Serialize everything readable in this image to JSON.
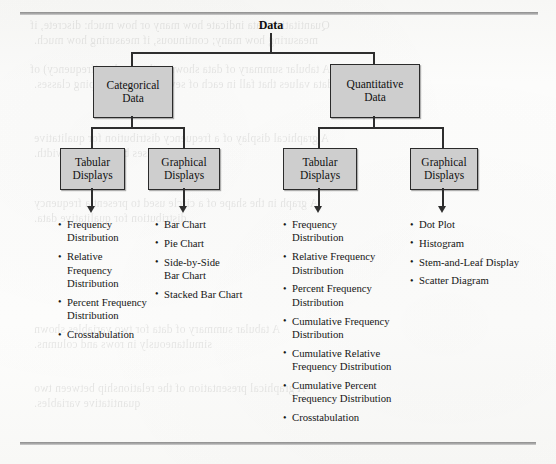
{
  "figure": {
    "root": {
      "label": "Data"
    },
    "level2": [
      {
        "label": "Categorical\nData"
      },
      {
        "label": "Quantitative\nData"
      }
    ],
    "level3": [
      {
        "label": "Tabular\nDisplays"
      },
      {
        "label": "Graphical\nDisplays"
      },
      {
        "label": "Tabular\nDisplays"
      },
      {
        "label": "Graphical\nDisplays"
      }
    ],
    "lists": [
      {
        "name": "categorical-tabular-list",
        "items": [
          "Frequency\nDistribution",
          "Relative Frequency\nDistribution",
          "Percent Frequency\nDistribution",
          "Crosstabulation"
        ]
      },
      {
        "name": "categorical-graphical-list",
        "items": [
          "Bar Chart",
          "Pie Chart",
          "Side-by-Side\nBar Chart",
          "Stacked Bar Chart"
        ]
      },
      {
        "name": "quantitative-tabular-list",
        "items": [
          "Frequency\nDistribution",
          "Relative Frequency\nDistribution",
          "Percent Frequency\nDistribution",
          "Cumulative Frequency\nDistribution",
          "Cumulative Relative\nFrequency Distribution",
          "Cumulative Percent\nFrequency Distribution",
          "Crosstabulation"
        ]
      },
      {
        "name": "quantitative-graphical-list",
        "items": [
          "Dot Plot",
          "Histogram",
          "Stem-and-Leaf Display",
          "Scatter Diagram"
        ]
      }
    ]
  },
  "bleed_through": {
    "line1": "Quantitative data indicate how many or how much: discrete, if",
    "line2": "measuring how many; continuous, if measuring how much.",
    "line3": "A tabular summary of data showing the number (frequency) of",
    "line4": "data values that fall in each of several nonoverlapping classes.",
    "line5": "A graphical display of a frequency distribution for qualitative",
    "line6": "data that uses bars of equal width.",
    "line7": "A graph in the shape of a circle used to present a frequency",
    "line8": "distribution for qualitative data.",
    "line9": "A tabular summary of data for two variables shown",
    "line10": "simultaneously in rows and columns.",
    "line11": "A graphical presentation of the relationship between two",
    "line12": "quantitative variables."
  },
  "colors": {
    "box_fill": "#cecece",
    "box_border": "#2b2b2b",
    "connector": "#2e2e2e",
    "text": "#161616",
    "page": "#fbfbfa"
  }
}
